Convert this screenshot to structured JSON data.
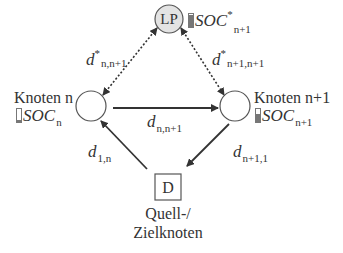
{
  "diagram": {
    "nodes": {
      "lp": {
        "label": "LP",
        "fill": "#e3e3e3",
        "soc_symbol": "SOC",
        "soc_sup": "*",
        "soc_sub": "n+1",
        "battery_level": 0.95
      },
      "knoten_n": {
        "title": "Knoten n",
        "soc_symbol": "SOC",
        "soc_sub": "n",
        "battery_level": 0.15
      },
      "knoten_n1": {
        "title": "Knoten n+1",
        "soc_symbol": "SOC",
        "soc_sub": "n+1",
        "battery_level": 0.6
      },
      "depot": {
        "label": "D",
        "caption_line1": "Quell-/",
        "caption_line2": "Zielknoten"
      }
    },
    "edges": {
      "d_star_n_n1": {
        "symbol": "d",
        "sup": "*",
        "sub": "n,n+1",
        "style": "dotted",
        "direction": "bidirectional"
      },
      "d_star_n1_n1": {
        "symbol": "d",
        "sup": "*",
        "sub": "n+1,n+1",
        "style": "dotted",
        "direction": "bidirectional"
      },
      "d_n_n1": {
        "symbol": "d",
        "sub": "n,n+1",
        "style": "solid",
        "from": "Knoten n",
        "to": "Knoten n+1"
      },
      "d_1_n": {
        "symbol": "d",
        "sub": "1,n",
        "style": "solid",
        "from": "D",
        "to": "Knoten n"
      },
      "d_n1_1": {
        "symbol": "d",
        "sub": "n+1,1",
        "style": "solid",
        "from": "Knoten n+1",
        "to": "D"
      }
    },
    "colors": {
      "stroke": "#333333",
      "lp_fill": "#e3e3e3",
      "battery": "#777777"
    }
  }
}
